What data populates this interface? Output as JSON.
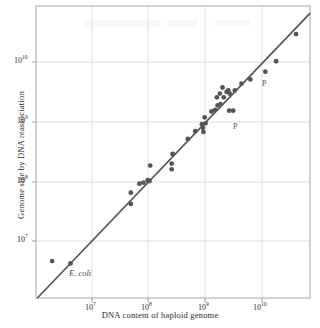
{
  "chart_data": {
    "type": "scatter",
    "title": "",
    "xlabel": "DNA content of haploid genome",
    "ylabel": "Genome size by DNA reassociation",
    "xscale": "log",
    "yscale": "log",
    "xlim": [
      3000000,
      60000000000
    ],
    "ylim": [
      3000000,
      60000000000
    ],
    "xticks": [
      10000000,
      100000000,
      1000000000,
      10000000000
    ],
    "xticklabels": [
      "10⁷",
      "10⁸",
      "10⁹",
      "10¹⁰"
    ],
    "yticks": [
      10000000,
      100000000,
      1000000000,
      10000000000
    ],
    "yticklabels": [
      "10⁷",
      "10⁸",
      "10⁹",
      "10¹⁰"
    ],
    "grid": true,
    "legend": null,
    "reference_line": {
      "label": "identity line (y = x)",
      "slope": 1,
      "color": "#555555"
    },
    "marker_color": "#555555",
    "points": [
      {
        "x": 2000000.0,
        "y": 4600000.0
      },
      {
        "x": 4200000.0,
        "y": 4200000.0,
        "label": "E. coli"
      },
      {
        "x": 48000000.0,
        "y": 65000000.0
      },
      {
        "x": 48000000.0,
        "y": 42000000.0
      },
      {
        "x": 68000000.0,
        "y": 92000000.0
      },
      {
        "x": 80000000.0,
        "y": 96000000.0
      },
      {
        "x": 95000000.0,
        "y": 105000000.0
      },
      {
        "x": 102000000.0,
        "y": 102000000.0
      },
      {
        "x": 105000000.0,
        "y": 185000000.0
      },
      {
        "x": 250000000.0,
        "y": 200000000.0
      },
      {
        "x": 250000000.0,
        "y": 160000000.0
      },
      {
        "x": 260000000.0,
        "y": 290000000.0
      },
      {
        "x": 480000000.0,
        "y": 520000000.0
      },
      {
        "x": 650000000.0,
        "y": 700000000.0
      },
      {
        "x": 850000000.0,
        "y": 920000000.0
      },
      {
        "x": 880000000.0,
        "y": 800000000.0
      },
      {
        "x": 900000000.0,
        "y": 680000000.0
      },
      {
        "x": 950000000.0,
        "y": 1200000000.0
      },
      {
        "x": 980000000.0,
        "y": 950000000.0
      },
      {
        "x": 1250000000.0,
        "y": 1500000000.0
      },
      {
        "x": 1450000000.0,
        "y": 1600000000.0
      },
      {
        "x": 1550000000.0,
        "y": 2600000000.0
      },
      {
        "x": 1600000000.0,
        "y": 1900000000.0
      },
      {
        "x": 1750000000.0,
        "y": 3000000000.0
      },
      {
        "x": 1800000000.0,
        "y": 2000000000.0
      },
      {
        "x": 1950000000.0,
        "y": 3800000000.0
      },
      {
        "x": 2050000000.0,
        "y": 2600000000.0
      },
      {
        "x": 2300000000.0,
        "y": 3200000000.0
      },
      {
        "x": 2450000000.0,
        "y": 3400000000.0
      },
      {
        "x": 2550000000.0,
        "y": 1550000000.0
      },
      {
        "x": 2600000000.0,
        "y": 3000000000.0
      },
      {
        "x": 3000000000.0,
        "y": 1550000000.0,
        "label": "P"
      },
      {
        "x": 3200000000.0,
        "y": 3400000000.0
      },
      {
        "x": 4200000000.0,
        "y": 4400000000.0
      },
      {
        "x": 6000000000.0,
        "y": 5200000000.0
      },
      {
        "x": 11000000000.0,
        "y": 7000000000.0,
        "label": "P"
      },
      {
        "x": 17000000000.0,
        "y": 10500000000.0
      },
      {
        "x": 38000000000.0,
        "y": 30000000000.0
      }
    ],
    "annotations": [
      {
        "text": "E. coli",
        "style": "italic",
        "x_px": 69,
        "y_px": 268
      },
      {
        "text": "P",
        "style": "plain",
        "x_px": 233,
        "y_px": 122
      },
      {
        "text": "P",
        "style": "plain",
        "x_px": 262,
        "y_px": 79
      }
    ]
  },
  "axes": {
    "xlabel": "DNA content of haploid genome",
    "ylabel": "Genome size by DNA reassociation",
    "xticklabels": [
      "10",
      "10",
      "10",
      "10"
    ],
    "xtick_exponents": [
      "7",
      "8",
      "9",
      "10"
    ],
    "yticklabels": [
      "10",
      "10",
      "10",
      "10"
    ],
    "ytick_exponents": [
      "7",
      "8",
      "9",
      "10"
    ]
  },
  "colors": {
    "marker": "#555555",
    "line": "#555555",
    "frame": "#b8b8b8",
    "grid": "#d4d4d4",
    "text": "#2b2b2b",
    "background": "#ffffff"
  }
}
